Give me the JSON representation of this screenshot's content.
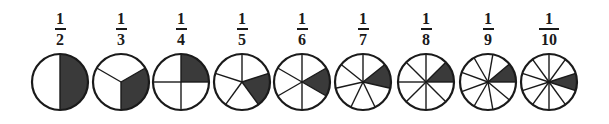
{
  "diagram": {
    "title": "",
    "colors": {
      "stroke": "#1a1a1a",
      "shaded": "#3a3a3a",
      "fill": "#ffffff"
    },
    "items": [
      {
        "numerator": "1",
        "denominator": "2",
        "parts": 2,
        "shaded_start_deg": 90,
        "cx": 60,
        "line_offset_deg": 90
      },
      {
        "numerator": "1",
        "denominator": "3",
        "parts": 3,
        "shaded_start_deg": 30,
        "cx": 121,
        "line_offset_deg": 270
      },
      {
        "numerator": "1",
        "denominator": "4",
        "parts": 4,
        "shaded_start_deg": 90,
        "cx": 181,
        "line_offset_deg": 90
      },
      {
        "numerator": "1",
        "denominator": "5",
        "parts": 5,
        "shaded_start_deg": 18,
        "cx": 242,
        "line_offset_deg": 90
      },
      {
        "numerator": "1",
        "denominator": "6",
        "parts": 6,
        "shaded_start_deg": 30,
        "cx": 302,
        "line_offset_deg": 90
      },
      {
        "numerator": "1",
        "denominator": "7",
        "parts": 7,
        "shaded_start_deg": 38.57,
        "cx": 363,
        "line_offset_deg": 90
      },
      {
        "numerator": "1",
        "denominator": "8",
        "parts": 8,
        "shaded_start_deg": 45,
        "cx": 426,
        "line_offset_deg": 90
      },
      {
        "numerator": "1",
        "denominator": "9",
        "parts": 9,
        "shaded_start_deg": 40,
        "cx": 488,
        "line_offset_deg": 0
      },
      {
        "numerator": "1",
        "denominator": "10",
        "parts": 10,
        "shaded_start_deg": 18,
        "cx": 549,
        "line_offset_deg": 90
      }
    ]
  }
}
